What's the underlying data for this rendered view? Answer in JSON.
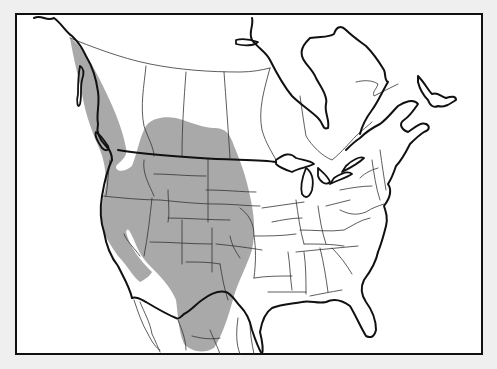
{
  "map": {
    "subject": "North America species range map",
    "colors": {
      "page_background": "#efefef",
      "map_background": "#ffffff",
      "range_fill": "#a9a9a9",
      "border_major": "#111111",
      "border_minor": "#333333"
    },
    "frame": {
      "x": 16,
      "y": 14,
      "width": 466,
      "height": 340
    },
    "range_region": {
      "label": "range-shading",
      "path": "M70,38 C80,44 90,60 100,80 C112,104 122,126 126,148 C128,156 122,160 118,164 C112,168 120,176 132,166 C138,150 140,136 146,126 C152,118 164,116 176,118 C190,122 204,128 214,128 C226,128 230,134 234,146 C240,160 246,176 250,196 C254,214 256,232 252,250 C246,268 238,282 234,296 C228,318 222,336 214,348 C204,354 192,352 184,344 C178,330 178,314 176,300 C172,290 164,280 154,270 C146,262 140,256 134,240 C130,232 128,226 126,232 C130,248 140,260 152,272 C150,276 144,280 140,282 C132,276 128,266 118,256 C110,244 104,236 102,224 C100,208 104,196 106,184 C106,172 104,160 100,150 C94,136 88,122 84,104 C80,82 74,62 70,38 Z"
    },
    "coastlines": [
      "M34,18 C42,14 46,22 54,18 C62,24 66,32 72,36 C80,44 82,48 86,56 C92,66 96,76 98,92 C100,104 96,114 98,124 C96,132 100,140 106,146 C110,150 112,156 112,160",
      "M112,160 C106,172 104,184 102,196 C100,208 100,220 104,232 C106,244 110,256 118,266 C124,278 130,288 132,298",
      "M132,298 C136,296 142,300 146,302 C156,308 166,314 176,318 C178,320 182,316 184,314 C192,310 196,304 202,300 C210,294 218,290 226,292 C232,294 236,302 240,306 C246,312 250,320 252,330 C256,342 258,348 262,354",
      "M262,354 C264,348 262,340 260,332 C262,320 266,312 272,308 C282,304 292,304 302,302 C310,300 318,304 326,302 C334,298 342,300 350,306 C356,316 360,326 366,336 C370,338 374,338 376,330 C376,320 372,310 366,302 C362,296 360,288 364,280 C370,272 376,262 378,252",
      "M378,252 C382,242 384,234 386,226 C388,218 386,212 384,206 C390,198 392,190 388,184 C392,178 394,172 396,166 C402,160 406,152 410,144 C414,140 418,136 424,132 C430,130 430,126 426,124",
      "M426,124 C420,122 414,128 408,132 C402,130 398,124 404,120 C410,116 414,110 418,104 C414,98 404,102 398,106 C392,112 388,118 380,124 C372,128 366,132 360,138 C354,142 350,146 346,150",
      "M252,18 C254,26 248,32 252,40 C258,48 266,52 270,60 C276,72 282,84 292,96 C300,104 312,112 318,118 C324,124 322,130 328,128 C330,120 324,112 326,104 C328,96 320,86 316,78 C312,68 304,64 302,56 C300,48 306,42 310,38 C320,36 328,38 334,34 C336,28 340,24 346,30 C352,36 358,40 366,46 C372,52 378,60 384,70 C386,74 384,80 388,82 C382,92 378,102 372,110 C366,118 362,126 360,134",
      "M418,76 C424,82 428,90 432,94 C438,92 440,96 446,98 C452,96 456,96 456,100 C450,104 444,108 438,106 C434,108 430,106 428,100 C424,96 420,90 418,82 Z"
    ],
    "islands": [
      "M96,132 C100,134 104,140 108,146 C110,150 106,152 102,148 C98,142 94,136 96,132 Z",
      "M80,66 C84,68 84,74 82,80 C80,88 82,96 80,104 C78,110 76,102 78,94 C78,86 78,76 80,66 Z",
      "M236,40 C244,38 252,40 258,42 C254,46 244,46 236,44 Z"
    ],
    "great_lakes": [
      "M276,160 C284,154 290,152 296,158 C302,160 310,160 314,164 C306,168 298,168 292,172 C286,170 280,168 276,164 Z",
      "M306,168 C312,172 314,180 312,190 C310,196 306,200 302,194 C300,186 302,178 306,168 Z",
      "M318,168 C322,172 328,176 330,182 C326,186 320,182 318,176 Z",
      "M330,184 C338,180 346,178 352,174 C348,170 340,174 334,178 Z",
      "M342,172 C350,168 358,164 364,158 C360,156 352,160 346,166 Z"
    ],
    "international_border": "M118,150 C140,154 170,156 200,158 C230,160 262,160 276,162",
    "province_lines": [
      "M70,38 C90,46 120,58 150,64 C180,70 210,72 240,72 C252,72 262,70 270,68",
      "M146,66 C144,86 140,106 144,126 C148,138 154,148 154,156",
      "M186,72 C184,100 182,126 182,156",
      "M224,72 C226,100 228,126 230,158",
      "M270,68 C264,90 258,110 262,130 C266,144 272,152 276,160",
      "M300,96 C302,110 304,124 306,136 C312,146 322,156 332,160 C342,152 350,142 356,136 C362,130 368,126 372,122",
      "M356,82 C364,80 372,80 378,84 C376,90 372,92 374,96 C382,92 390,88 398,84"
    ],
    "state_lines": [
      "M102,196 C122,198 142,200 160,200 C180,202 200,204 216,204 C232,204 248,206 260,206",
      "M110,160 C108,172 108,186 106,196",
      "M144,160 C142,174 150,186 154,196",
      "M152,198 C150,216 148,236 144,256",
      "M154,174 C170,174 186,176 206,176",
      "M168,190 C168,200 170,212 168,222",
      "M168,218 C188,218 210,220 230,220",
      "M208,158 C208,178 208,200 208,222",
      "M206,190 C226,190 242,192 256,192",
      "M182,220 C182,236 182,250 182,264",
      "M150,242 C170,242 190,244 212,244",
      "M216,244 C236,246 250,248 262,250",
      "M212,228 C212,244 212,260 212,272",
      "M186,262 C198,262 210,262 220,264",
      "M220,264 C222,276 224,288 228,300",
      "M230,236 C232,246 236,252 240,258",
      "M124,234 C126,240 134,248 140,256",
      "M240,208 C248,214 254,222 254,236 C256,248 256,262 254,278",
      "M254,236 C268,236 282,236 296,234",
      "M254,278 C266,276 280,276 292,276",
      "M262,208 C276,206 290,204 304,202",
      "M272,222 C282,220 292,218 302,218",
      "M296,200 C298,214 300,230 304,244",
      "M304,244 C318,244 332,244 344,246",
      "M300,230 C314,230 330,232 344,230 C352,226 360,220 370,218",
      "M318,206 C320,220 322,232 326,244",
      "M326,206 C334,204 342,202 350,200",
      "M340,210 C348,214 356,216 366,212 C372,208 378,206 384,204",
      "M288,252 C290,264 290,276 292,290",
      "M304,252 C306,266 306,280 306,294",
      "M320,248 C324,264 326,278 328,292",
      "M332,248 C340,256 346,264 352,274",
      "M296,252 C316,250 336,248 358,246",
      "M268,292 C280,292 292,292 306,292",
      "M310,296 C320,294 330,292 342,290",
      "M340,190 C350,188 362,186 372,186",
      "M360,178 C366,172 372,170 378,168",
      "M372,160 C374,174 376,188 380,200",
      "M380,150 C382,164 384,178 386,190"
    ],
    "mexico_lines": [
      "M134,300 C138,312 142,324 148,334 C152,342 156,348 160,350",
      "M140,302 C144,312 150,322 152,334 C156,342 158,348 160,352",
      "M178,320 C182,330 186,340 186,350",
      "M192,336 C200,338 210,340 220,338",
      "M210,330 C214,340 218,348 220,354",
      "M238,318 C236,332 236,344 240,354",
      "M250,322 C250,334 252,344 254,354"
    ]
  }
}
